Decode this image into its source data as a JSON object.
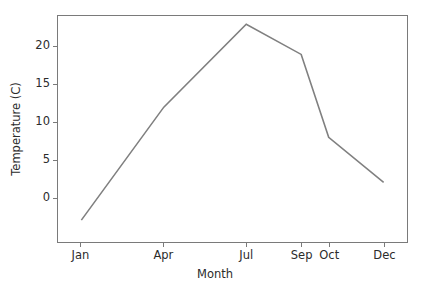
{
  "chart_data": {
    "type": "line",
    "title": "",
    "xlabel": "Month",
    "ylabel": "Temperature (C)",
    "categories": [
      "Jan",
      "Apr",
      "Jul",
      "Sep",
      "Oct",
      "Dec"
    ],
    "x": [
      1,
      4,
      7,
      9,
      10,
      12
    ],
    "values": [
      -3,
      12,
      23,
      19,
      8,
      2
    ],
    "series": [
      {
        "name": "Temperature",
        "values": [
          -3,
          12,
          23,
          19,
          8,
          2
        ],
        "color": "#808080"
      }
    ],
    "xtick_labels": [
      "Jan",
      "Apr",
      "Jul",
      "Sep",
      "Oct",
      "Dec"
    ],
    "xtick_values": [
      1,
      4,
      7,
      9,
      10,
      12
    ],
    "ytick_labels": [
      "0",
      "5",
      "10",
      "15",
      "20"
    ],
    "ytick_values": [
      0,
      5,
      10,
      15,
      20
    ],
    "xlim": [
      0.15,
      12.85
    ],
    "ylim": [
      -5.9,
      24.1
    ],
    "grid": false,
    "legend": false,
    "line_color": "#808080",
    "line_width": 1.6,
    "axes_color": "#7a7a7a",
    "text_color": "#2b2b2b",
    "background_color": "#ffffff"
  }
}
